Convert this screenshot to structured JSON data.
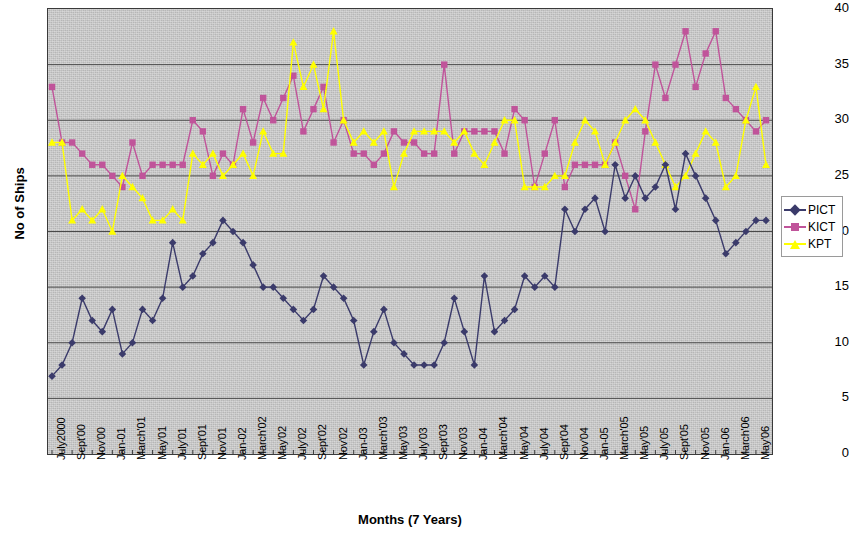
{
  "chart_data": {
    "type": "line",
    "title": "",
    "xlabel": "Months (7 Years)",
    "ylabel": "No of Ships",
    "ylim": [
      0,
      40
    ],
    "ytick_step": 5,
    "yticks": [
      0,
      5,
      10,
      15,
      20,
      25,
      30,
      35,
      40
    ],
    "grid": "horizontal",
    "legend_position": "right",
    "plot_background": "#c9c9c9",
    "x_tick_labels": [
      "July2000",
      "Sept'00",
      "Nov'00",
      "Jan-01",
      "March'01",
      "May'01",
      "July'01",
      "Sept'01",
      "Nov'01",
      "Jan-02",
      "March'02",
      "May'02",
      "July'02",
      "Sept'02",
      "Nov'02",
      "Jan-03",
      "March'03",
      "May'03",
      "July'03",
      "Sept'03",
      "Nov'03",
      "Jan-04",
      "March'04",
      "May'04",
      "July'04",
      "Sept'04",
      "Nov'04",
      "Jan-05",
      "March'05",
      "May'05",
      "July'05",
      "Sept'05",
      "Nov'05",
      "Jan-06",
      "March'06",
      "May'06"
    ],
    "x_label_interval_months": 2,
    "x_count": 72,
    "series": [
      {
        "name": "PICT",
        "color": "#3b3b6b",
        "marker": "diamond",
        "values": [
          7,
          8,
          10,
          14,
          12,
          11,
          13,
          9,
          10,
          13,
          12,
          14,
          19,
          15,
          16,
          18,
          19,
          21,
          20,
          19,
          17,
          15,
          15,
          14,
          13,
          12,
          13,
          16,
          15,
          14,
          12,
          8,
          11,
          13,
          10,
          9,
          8,
          8,
          8,
          10,
          14,
          11,
          8,
          16,
          11,
          12,
          13,
          16,
          15,
          16,
          15,
          22,
          20,
          22,
          23,
          20,
          26,
          23,
          25,
          23,
          24,
          26,
          22,
          27,
          25,
          23,
          21,
          18,
          19,
          20,
          21,
          21
        ]
      },
      {
        "name": "KICT",
        "color": "#c0549a",
        "marker": "square",
        "values": [
          33,
          28,
          28,
          27,
          26,
          26,
          25,
          24,
          28,
          25,
          26,
          26,
          26,
          26,
          30,
          29,
          25,
          27,
          26,
          31,
          28,
          32,
          30,
          32,
          34,
          29,
          31,
          33,
          28,
          30,
          27,
          27,
          26,
          27,
          29,
          28,
          28,
          27,
          27,
          35,
          27,
          29,
          29,
          29,
          29,
          27,
          31,
          30,
          24,
          27,
          30,
          24,
          26,
          26,
          26,
          26,
          28,
          25,
          22,
          29,
          35,
          32,
          35,
          38,
          33,
          36,
          38,
          32,
          31,
          30,
          29,
          30
        ]
      },
      {
        "name": "KPT",
        "color": "#ffff00",
        "marker": "triangle",
        "values": [
          28,
          28,
          21,
          22,
          21,
          22,
          20,
          25,
          24,
          23,
          21,
          21,
          22,
          21,
          27,
          26,
          27,
          25,
          26,
          27,
          25,
          29,
          27,
          27,
          37,
          33,
          35,
          31,
          38,
          30,
          28,
          29,
          28,
          29,
          24,
          27,
          29,
          29,
          29,
          29,
          28,
          29,
          27,
          26,
          28,
          30,
          30,
          24,
          24,
          24,
          25,
          25,
          28,
          30,
          29,
          26,
          28,
          30,
          31,
          30,
          28,
          26,
          24,
          25,
          27,
          29,
          28,
          24,
          25,
          30,
          33,
          26
        ]
      }
    ]
  },
  "legend": {
    "items": [
      {
        "label": "PICT"
      },
      {
        "label": "KICT"
      },
      {
        "label": "KPT"
      }
    ]
  }
}
